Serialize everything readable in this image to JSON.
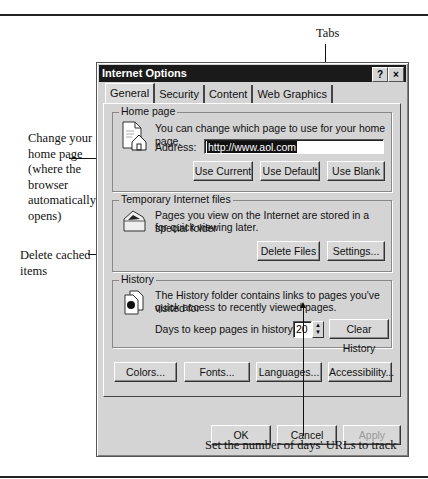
{
  "annotations": {
    "tabs": "Tabs",
    "home_page": [
      "Change your",
      "home page",
      "(where the",
      "browser",
      "automatically",
      "opens)"
    ],
    "delete_cached": [
      "Delete cached",
      "items"
    ],
    "days_urls": "Set the number of days' URLs to track"
  },
  "dialog": {
    "title": "Internet Options",
    "help_button": "?",
    "close_button": "×",
    "tabs": [
      {
        "label": "General",
        "active": true
      },
      {
        "label": "Security",
        "active": false
      },
      {
        "label": "Content",
        "active": false
      },
      {
        "label": "Web Graphics",
        "active": false
      }
    ],
    "home_page": {
      "legend": "Home page",
      "description": "You can change which page to use for your home page.",
      "address_label": "Address:",
      "address_value": "http://www.aol.com",
      "buttons": {
        "use_current": "Use Current",
        "use_default": "Use Default",
        "use_blank": "Use Blank"
      },
      "icon": "home-page-icon"
    },
    "temp_files": {
      "legend": "Temporary Internet files",
      "description_1": "Pages you view on the Internet are stored in a special folder",
      "description_2": "for quick viewing later.",
      "buttons": {
        "delete_files": "Delete Files",
        "settings": "Settings..."
      },
      "icon": "folder-icon"
    },
    "history": {
      "legend": "History",
      "description_1": "The History folder contains links to pages you've visited for",
      "description_2": "quick access to recently viewed pages.",
      "days_label": "Days to keep pages in history:",
      "days_value": "20",
      "buttons": {
        "clear_history": "Clear History"
      },
      "icon": "history-icon"
    },
    "bottom_buttons": {
      "colors": "Colors...",
      "fonts": "Fonts...",
      "languages": "Languages...",
      "accessibility": "Accessibility..."
    },
    "dialog_buttons": {
      "ok": "OK",
      "cancel": "Cancel",
      "apply": "Apply"
    }
  }
}
